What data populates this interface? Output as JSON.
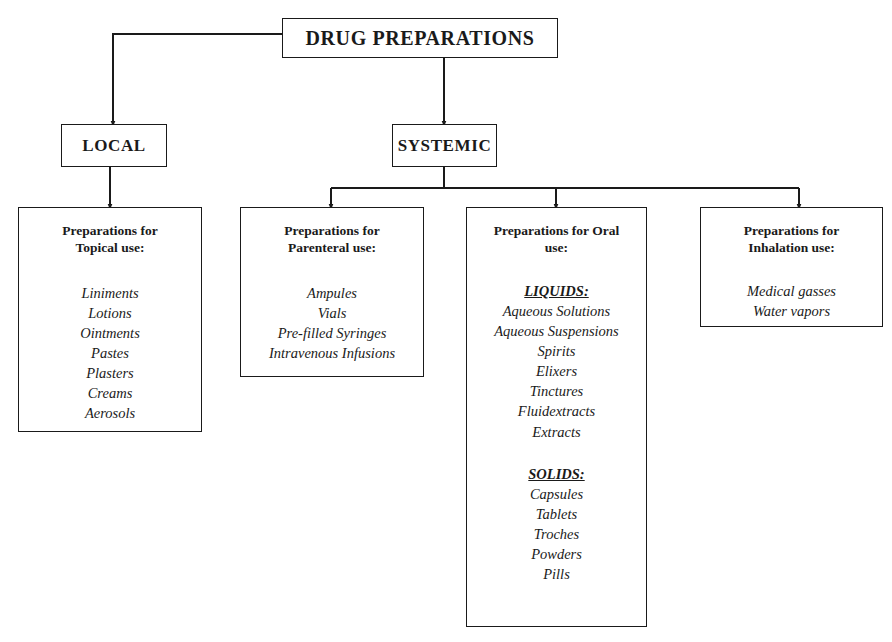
{
  "diagram": {
    "root": {
      "label": "DRUG PREPARATIONS"
    },
    "branches": {
      "local": {
        "label": "LOCAL"
      },
      "systemic": {
        "label": "SYSTEMIC"
      }
    },
    "categories": {
      "topical": {
        "heading": "Preparations for\nTopical use:",
        "items": [
          "Liniments",
          "Lotions",
          "Ointments",
          "Pastes",
          "Plasters",
          "Creams",
          "Aerosols"
        ]
      },
      "parenteral": {
        "heading": "Preparations for\nParenteral use:",
        "items": [
          "Ampules",
          "Vials",
          "Pre-filled Syringes",
          "Intravenous Infusions"
        ]
      },
      "oral": {
        "heading": "Preparations for Oral\nuse:",
        "groups": [
          {
            "label": "LIQUIDS:",
            "items": [
              "Aqueous Solutions",
              "Aqueous Suspensions",
              "Spirits",
              "Elixers",
              "Tinctures",
              "Fluidextracts",
              "Extracts"
            ]
          },
          {
            "label": "SOLIDS:",
            "items": [
              "Capsules",
              "Tablets",
              "Troches",
              "Powders",
              "Pills"
            ]
          }
        ]
      },
      "inhalation": {
        "heading": "Preparations for\nInhalation use:",
        "items": [
          "Medical gasses",
          "Water vapors"
        ]
      }
    },
    "style": {
      "line_color": "#1a1a1a",
      "box_border_color": "#1a1a1a",
      "background": "#ffffff"
    }
  }
}
